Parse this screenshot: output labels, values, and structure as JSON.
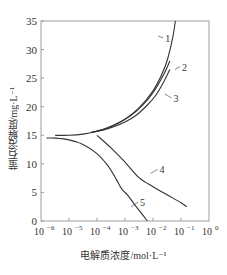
{
  "chart_data": {
    "type": "line",
    "title": "",
    "xlabel": "电解质浓度/mol·L⁻¹",
    "ylabel": "萤石溶解度/mg·L⁻¹",
    "xscale": "log",
    "xlim_exponent": [
      -6,
      0
    ],
    "ylim": [
      0,
      35
    ],
    "grid": false,
    "legend": "inline numeric labels on curves",
    "x_ticks": [
      "10⁻⁶",
      "10⁻⁵",
      "10⁻⁴",
      "10⁻³",
      "10⁻²",
      "10⁻¹",
      "10⁰"
    ],
    "x_tick_exponents": [
      -6,
      -5,
      -4,
      -3,
      -2,
      -1,
      0
    ],
    "y_ticks": [
      0,
      5,
      10,
      15,
      20,
      25,
      30,
      35
    ],
    "series": [
      {
        "name": "1",
        "x_log10": [
          -5.5,
          -5.0,
          -4.5,
          -4.0,
          -3.5,
          -3.0,
          -2.5,
          -2.0,
          -1.7,
          -1.5,
          -1.3,
          -1.2
        ],
        "y": [
          15.0,
          15.0,
          15.2,
          15.7,
          16.5,
          17.8,
          19.8,
          22.8,
          25.5,
          28.0,
          32.0,
          35.0
        ]
      },
      {
        "name": "2",
        "x_log10": [
          -4.2,
          -3.8,
          -3.4,
          -3.0,
          -2.6,
          -2.2,
          -1.9,
          -1.6,
          -1.4
        ],
        "y": [
          15.5,
          16.0,
          16.8,
          17.8,
          19.2,
          21.2,
          23.2,
          25.8,
          28.0
        ]
      },
      {
        "name": "3",
        "x_log10": [
          -4.2,
          -3.8,
          -3.4,
          -3.0,
          -2.6,
          -2.2,
          -1.9,
          -1.6,
          -1.4
        ],
        "y": [
          15.5,
          15.9,
          16.5,
          17.3,
          18.5,
          20.3,
          22.0,
          24.5,
          26.5
        ]
      },
      {
        "name": "4",
        "x_log10": [
          -4.0,
          -3.5,
          -3.0,
          -2.5,
          -2.0,
          -1.5,
          -1.0,
          -0.8
        ],
        "y": [
          15.0,
          12.8,
          10.3,
          7.6,
          6.0,
          4.6,
          3.2,
          2.5
        ]
      },
      {
        "name": "5",
        "x_log10": [
          -5.8,
          -5.5,
          -5.0,
          -4.5,
          -4.0,
          -3.6,
          -3.3,
          -3.1,
          -2.9,
          -2.6,
          -2.2
        ],
        "y": [
          14.5,
          14.5,
          14.2,
          13.4,
          11.8,
          9.6,
          7.2,
          5.5,
          4.5,
          2.5,
          0.0
        ]
      }
    ],
    "curve_labels": [
      {
        "text": "1",
        "x_log10": -1.6,
        "y": 31.5
      },
      {
        "text": "2",
        "x_log10": -1.0,
        "y": 26.5
      },
      {
        "text": "3",
        "x_log10": -1.3,
        "y": 21.0
      },
      {
        "text": "4",
        "x_log10": -1.8,
        "y": 8.5
      },
      {
        "text": "5",
        "x_log10": -2.5,
        "y": 2.8
      }
    ]
  },
  "style": {
    "line_color": "#333333",
    "axis_color": "#777777",
    "text_color": "#333333"
  }
}
